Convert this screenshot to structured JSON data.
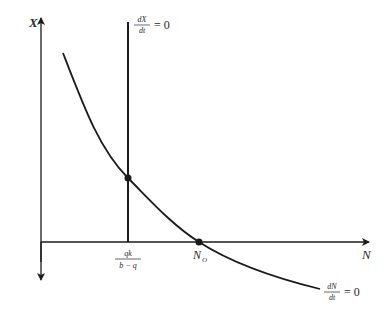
{
  "diagram": {
    "type": "phase-plane",
    "axes": {
      "y_label": "X",
      "x_label": "N"
    },
    "isoclines": {
      "vertical": {
        "numerator": "dX",
        "denominator": "dt",
        "equals": "= 0"
      },
      "curve": {
        "numerator": "dN",
        "denominator": "dt",
        "equals": "= 0"
      }
    },
    "tick_labels": {
      "vertical_intercept": {
        "numerator": "qk",
        "denominator": "b − q"
      },
      "n0": {
        "base": "N",
        "sub": "O"
      }
    },
    "points": [
      {
        "name": "equilibrium",
        "x": 128,
        "y": 178
      },
      {
        "name": "N0",
        "x": 199,
        "y": 242
      }
    ],
    "colors": {
      "line": "#1a1a1a",
      "text": "#2a2a2a"
    }
  }
}
